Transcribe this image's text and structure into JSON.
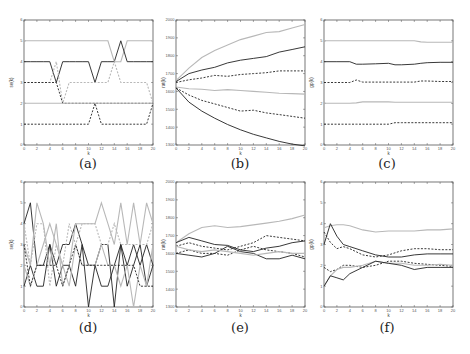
{
  "figure": {
    "captions": [
      "(a)",
      "(b)",
      "(c)",
      "(d)",
      "(e)",
      "(f)"
    ]
  },
  "colors": {
    "black": "#222222",
    "gray": "#b8b8b8",
    "axis": "#555555"
  },
  "chart_data": [
    {
      "id": "a",
      "type": "line",
      "caption": "(a)",
      "xlabel": "k",
      "ylabel": "se(k)",
      "xlim": [
        0,
        20
      ],
      "ylim": [
        0,
        6
      ],
      "xticks": [
        0,
        2,
        4,
        6,
        8,
        10,
        12,
        14,
        16,
        18,
        20
      ],
      "yticks": [
        0,
        1,
        2,
        3,
        4,
        5,
        6
      ],
      "x": [
        0,
        1,
        2,
        3,
        4,
        5,
        6,
        7,
        8,
        9,
        10,
        11,
        12,
        13,
        14,
        15,
        16,
        17,
        18,
        19,
        20
      ],
      "series": [
        {
          "name": "gray-solid-top",
          "style": "gray",
          "values": [
            5,
            5,
            5,
            5,
            5,
            5,
            5,
            5,
            5,
            5,
            5,
            5,
            5,
            5,
            4,
            4,
            5,
            5,
            5,
            5,
            5
          ]
        },
        {
          "name": "black-solid",
          "style": "black",
          "values": [
            4,
            4,
            4,
            4,
            4,
            3,
            4,
            4,
            4,
            4,
            4,
            3,
            4,
            4,
            4,
            5,
            4,
            4,
            4,
            4,
            4
          ]
        },
        {
          "name": "gray-dotted",
          "style": "gray-dash",
          "values": [
            3,
            3,
            3,
            3,
            3,
            4,
            2,
            3,
            3,
            3,
            3,
            3,
            3,
            3,
            4,
            3,
            3,
            3,
            3,
            3,
            2
          ]
        },
        {
          "name": "black-dashed",
          "style": "black-dash",
          "values": [
            3,
            3,
            3,
            3,
            3,
            3,
            2,
            2,
            2,
            2,
            2,
            2,
            2,
            2,
            2,
            2,
            2,
            2,
            2,
            2,
            2
          ]
        },
        {
          "name": "gray-solid-low",
          "style": "gray",
          "values": [
            2,
            2,
            2,
            2,
            2,
            2,
            2,
            2,
            2,
            2,
            2,
            2,
            2,
            2,
            2,
            2,
            2,
            2,
            2,
            2,
            2
          ]
        },
        {
          "name": "black-dashed-bottom",
          "style": "black-dash",
          "values": [
            1,
            1,
            1,
            1,
            1,
            1,
            1,
            1,
            1,
            1,
            1,
            2,
            1,
            1,
            1,
            1,
            1,
            1,
            1,
            1,
            2
          ]
        }
      ]
    },
    {
      "id": "b",
      "type": "line",
      "caption": "(b)",
      "xlabel": "k",
      "ylabel": "rat(k)",
      "xlim": [
        0,
        20
      ],
      "ylim": [
        1300,
        2000
      ],
      "xticks": [
        0,
        2,
        4,
        6,
        8,
        10,
        12,
        14,
        16,
        18,
        20
      ],
      "yticks": [
        1300,
        1400,
        1500,
        1600,
        1700,
        1800,
        1900,
        2000
      ],
      "x": [
        0,
        2,
        4,
        6,
        8,
        10,
        12,
        14,
        16,
        18,
        20
      ],
      "series": [
        {
          "name": "gray-top",
          "style": "gray",
          "values": [
            1660,
            1730,
            1790,
            1830,
            1860,
            1890,
            1910,
            1930,
            1935,
            1955,
            1975
          ]
        },
        {
          "name": "black-top",
          "style": "black",
          "values": [
            1655,
            1700,
            1720,
            1735,
            1760,
            1775,
            1785,
            1795,
            1820,
            1835,
            1850
          ]
        },
        {
          "name": "black-dash-top",
          "style": "black-dash",
          "values": [
            1650,
            1665,
            1675,
            1690,
            1685,
            1695,
            1700,
            1705,
            1715,
            1715,
            1715
          ]
        },
        {
          "name": "gray-mid",
          "style": "gray",
          "values": [
            1625,
            1615,
            1612,
            1605,
            1610,
            1605,
            1600,
            1595,
            1590,
            1588,
            1585
          ]
        },
        {
          "name": "black-dash-low",
          "style": "black-dash",
          "values": [
            1620,
            1580,
            1550,
            1530,
            1510,
            1490,
            1495,
            1480,
            1470,
            1460,
            1450
          ]
        },
        {
          "name": "black-bottom",
          "style": "black",
          "values": [
            1620,
            1540,
            1490,
            1450,
            1415,
            1385,
            1360,
            1340,
            1320,
            1305,
            1295
          ]
        }
      ]
    },
    {
      "id": "c",
      "type": "line",
      "caption": "(c)",
      "xlabel": "k",
      "ylabel": "gp(k)",
      "xlim": [
        0,
        20
      ],
      "ylim": [
        0,
        6
      ],
      "xticks": [
        0,
        2,
        4,
        6,
        8,
        10,
        12,
        14,
        16,
        18,
        20
      ],
      "yticks": [
        0,
        1,
        2,
        3,
        4,
        5,
        6
      ],
      "x": [
        0,
        2,
        4,
        5,
        6,
        8,
        10,
        11,
        12,
        14,
        15,
        16,
        18,
        20
      ],
      "series": [
        {
          "name": "gray-top",
          "style": "gray",
          "values": [
            5,
            5,
            5,
            5,
            5,
            5,
            5,
            5,
            5,
            5,
            4.95,
            4.93,
            4.93,
            4.93
          ]
        },
        {
          "name": "black",
          "style": "black",
          "values": [
            4,
            4,
            4,
            3.88,
            3.88,
            3.9,
            3.92,
            3.85,
            3.85,
            3.88,
            3.92,
            3.95,
            3.97,
            3.97
          ]
        },
        {
          "name": "black-dash",
          "style": "black-dash",
          "values": [
            3,
            3,
            3,
            3.12,
            3.02,
            3.02,
            3.02,
            3.02,
            3.02,
            3.02,
            3.07,
            3.07,
            3.05,
            3.05
          ]
        },
        {
          "name": "gray-low",
          "style": "gray",
          "values": [
            2,
            2,
            2,
            2.02,
            2.07,
            2.07,
            2.07,
            2.05,
            2.05,
            2.05,
            2.05,
            2.05,
            2.05,
            2.05
          ]
        },
        {
          "name": "black-dash-bottom",
          "style": "black-dash",
          "values": [
            1,
            1,
            1,
            1,
            1,
            1,
            1,
            1.07,
            1.07,
            1.07,
            1.07,
            1.07,
            1.07,
            1.07
          ]
        }
      ]
    },
    {
      "id": "d",
      "type": "line",
      "caption": "(d)",
      "xlabel": "k",
      "ylabel": "se(k)",
      "xlim": [
        0,
        20
      ],
      "ylim": [
        0,
        6
      ],
      "xticks": [
        0,
        2,
        4,
        6,
        8,
        10,
        12,
        14,
        16,
        18,
        20
      ],
      "yticks": [
        0,
        1,
        2,
        3,
        4,
        5,
        6
      ],
      "x": [
        0,
        1,
        2,
        3,
        4,
        5,
        6,
        7,
        8,
        9,
        10,
        11,
        12,
        13,
        14,
        15,
        16,
        17,
        18,
        19,
        20
      ],
      "series": [
        {
          "name": "black-1",
          "style": "black",
          "values": [
            4,
            5,
            2,
            2,
            3,
            2,
            3,
            3,
            4,
            3,
            0,
            2,
            3,
            3,
            0,
            3,
            2,
            3,
            2,
            3,
            2
          ]
        },
        {
          "name": "black-2",
          "style": "black",
          "values": [
            1,
            2,
            1,
            1,
            3,
            1,
            2,
            2,
            1,
            3,
            2,
            2,
            1,
            1,
            2,
            3,
            1,
            2,
            3,
            1,
            2
          ]
        },
        {
          "name": "gray-1",
          "style": "gray",
          "values": [
            3,
            2,
            5,
            4,
            2,
            4,
            1,
            2,
            4,
            4,
            4,
            4,
            5,
            4,
            3,
            5,
            3,
            5,
            3,
            5,
            4
          ]
        },
        {
          "name": "gray-2",
          "style": "gray",
          "values": [
            2,
            1,
            2,
            3,
            4,
            3,
            2,
            1,
            3,
            2,
            2,
            2,
            3,
            2,
            2,
            1,
            2,
            0,
            2,
            1,
            3
          ]
        },
        {
          "name": "black-dash",
          "style": "black-dash",
          "values": [
            3,
            1,
            2,
            2,
            2,
            2,
            1,
            2,
            3,
            2,
            2,
            2,
            2,
            2,
            2,
            2,
            2,
            2,
            1,
            1,
            1
          ]
        },
        {
          "name": "gray-dash",
          "style": "gray-dash",
          "values": [
            4,
            2,
            4,
            4,
            1,
            3,
            2,
            4,
            3,
            4,
            4,
            4,
            3,
            3,
            4,
            3,
            3,
            3,
            3,
            3,
            4
          ]
        }
      ]
    },
    {
      "id": "e",
      "type": "line",
      "caption": "(e)",
      "xlabel": "k",
      "ylabel": "rat(k)",
      "xlim": [
        0,
        20
      ],
      "ylim": [
        1300,
        2000
      ],
      "xticks": [
        0,
        2,
        4,
        6,
        8,
        10,
        12,
        14,
        16,
        18,
        20
      ],
      "yticks": [
        1300,
        1400,
        1500,
        1600,
        1700,
        1800,
        1900,
        2000
      ],
      "x": [
        0,
        2,
        4,
        6,
        8,
        10,
        12,
        14,
        16,
        18,
        20
      ],
      "series": [
        {
          "name": "gray-top",
          "style": "gray",
          "values": [
            1660,
            1710,
            1745,
            1755,
            1745,
            1750,
            1760,
            1770,
            1780,
            1795,
            1815
          ]
        },
        {
          "name": "black-1",
          "style": "black",
          "values": [
            1660,
            1690,
            1670,
            1650,
            1645,
            1620,
            1610,
            1630,
            1640,
            1660,
            1670
          ]
        },
        {
          "name": "black-2",
          "style": "black",
          "values": [
            1600,
            1590,
            1580,
            1600,
            1640,
            1610,
            1600,
            1570,
            1570,
            1590,
            1570
          ]
        },
        {
          "name": "black-dash-1",
          "style": "black-dash",
          "values": [
            1640,
            1660,
            1640,
            1630,
            1620,
            1640,
            1660,
            1700,
            1690,
            1680,
            1670
          ]
        },
        {
          "name": "black-dash-2",
          "style": "black-dash",
          "values": [
            1600,
            1620,
            1600,
            1600,
            1590,
            1620,
            1640,
            1620,
            1610,
            1600,
            1580
          ]
        },
        {
          "name": "gray-low",
          "style": "gray",
          "values": [
            1640,
            1620,
            1610,
            1620,
            1610,
            1600,
            1590,
            1600,
            1610,
            1600,
            1600
          ]
        }
      ]
    },
    {
      "id": "f",
      "type": "line",
      "caption": "(f)",
      "xlabel": "k",
      "ylabel": "gp(k)",
      "xlim": [
        0,
        20
      ],
      "ylim": [
        0,
        6
      ],
      "xticks": [
        0,
        2,
        4,
        6,
        8,
        10,
        12,
        14,
        16,
        18,
        20
      ],
      "yticks": [
        0,
        1,
        2,
        3,
        4,
        5,
        6
      ],
      "x": [
        0,
        1,
        2,
        3,
        4,
        6,
        8,
        10,
        12,
        14,
        16,
        18,
        20
      ],
      "series": [
        {
          "name": "gray-top",
          "style": "gray",
          "values": [
            3.8,
            3.9,
            3.95,
            3.95,
            3.9,
            3.7,
            3.6,
            3.65,
            3.65,
            3.65,
            3.7,
            3.7,
            3.75
          ]
        },
        {
          "name": "black-1",
          "style": "black",
          "values": [
            3,
            4,
            3.4,
            3.0,
            2.9,
            2.7,
            2.5,
            2.4,
            2.4,
            2.5,
            2.55,
            2.55,
            2.55
          ]
        },
        {
          "name": "black-dash-1",
          "style": "black-dash",
          "values": [
            3.6,
            3.1,
            2.8,
            2.9,
            2.8,
            2.5,
            2.4,
            2.5,
            2.7,
            2.8,
            2.8,
            2.75,
            2.75
          ]
        },
        {
          "name": "black-dash-2",
          "style": "black-dash",
          "values": [
            1.9,
            1.7,
            1.8,
            2.0,
            2.0,
            1.9,
            2.0,
            2.2,
            2.2,
            2.1,
            2.05,
            2.0,
            1.95
          ]
        },
        {
          "name": "gray-low",
          "style": "gray",
          "values": [
            1.0,
            1.5,
            1.8,
            1.9,
            1.9,
            2.0,
            2.2,
            2.1,
            2.1,
            2.0,
            2.0,
            2.05,
            2.0
          ]
        },
        {
          "name": "black-2",
          "style": "black",
          "values": [
            1.0,
            1.5,
            1.4,
            1.3,
            1.6,
            1.9,
            2.2,
            2.1,
            2.0,
            1.8,
            1.9,
            1.9,
            1.9
          ]
        }
      ]
    }
  ]
}
